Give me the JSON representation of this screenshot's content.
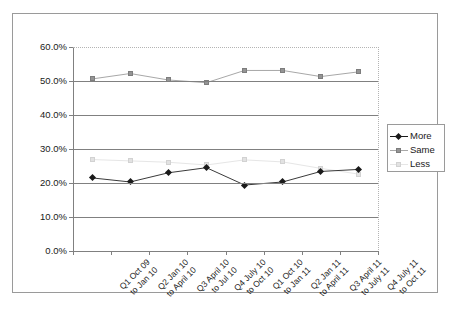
{
  "chart_data": {
    "type": "line",
    "title": "",
    "xlabel": "",
    "ylabel": "",
    "ylim": [
      0,
      60
    ],
    "grid": true,
    "legend_position": "right",
    "categories": [
      "Q1 Oct 09\nto Jan 10",
      "Q2 Jan 10\nto April 10",
      "Q3 April 10\nto Jul 10",
      "Q4 July 10\nto Oct 10",
      "Q1 Oct 10\nto Jan 11",
      "Q2 Jan 11\nto April 11",
      "Q3 April 11\nto July 11",
      "Q4 July 11\nto Oct 11"
    ],
    "category_lines": [
      [
        "Q1 Oct 09",
        "to Jan 10"
      ],
      [
        "Q2 Jan 10",
        "to April 10"
      ],
      [
        "Q3 April 10",
        "to Jul 10"
      ],
      [
        "Q4 July 10",
        "to Oct 10"
      ],
      [
        "Q1 Oct 10",
        "to Jan 11"
      ],
      [
        "Q2 Jan 11",
        "to April 11"
      ],
      [
        "Q3 April 11",
        "to July 11"
      ],
      [
        "Q4 July 11",
        "to Oct 11"
      ]
    ],
    "y_ticks": [
      "0.0%",
      "10.0%",
      "20.0%",
      "30.0%",
      "40.0%",
      "50.0%",
      "60.0%"
    ],
    "y_tick_values": [
      0,
      10,
      20,
      30,
      40,
      50,
      60
    ],
    "series": [
      {
        "name": "More",
        "color": "#1a1a1a",
        "marker": "diamond",
        "values": [
          21.5,
          20.3,
          23.0,
          24.5,
          19.4,
          20.3,
          23.4,
          24.0
        ]
      },
      {
        "name": "Same",
        "color": "#949494",
        "marker": "square",
        "values": [
          50.6,
          52.2,
          50.3,
          49.5,
          53.1,
          53.1,
          51.3,
          52.7
        ]
      },
      {
        "name": "Less",
        "color": "#e2e2e2",
        "marker": "square",
        "values": [
          26.9,
          26.5,
          26.1,
          25.3,
          26.8,
          26.2,
          24.3,
          22.6
        ]
      }
    ]
  },
  "legend": {
    "items": [
      {
        "label": "More"
      },
      {
        "label": "Same"
      },
      {
        "label": "Less"
      }
    ]
  }
}
